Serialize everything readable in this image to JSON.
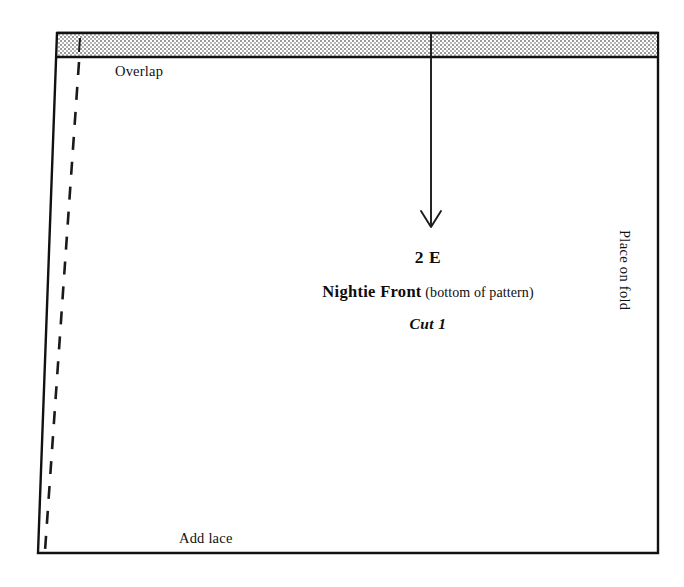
{
  "document": {
    "type": "sewing-pattern-piece",
    "background_color": "#ffffff",
    "ink_color": "#111111"
  },
  "piece": {
    "number": "2 E",
    "title": "Nightie Front",
    "title_note": "(bottom of pattern)",
    "cut_count": "Cut 1"
  },
  "labels": {
    "overlap": "Overlap",
    "add_lace": "Add lace",
    "place_on_fold": "Place on fold"
  },
  "markings": {
    "overlap_band": {
      "name": "overlap-allowance-band",
      "fill": "#c9c9c9",
      "pattern": "stipple-dither"
    },
    "grainline_arrow": {
      "name": "grainline-arrow",
      "direction": "down",
      "x": 431,
      "y_start": 33,
      "y_end": 227
    },
    "seam_allowance_dashed_line": {
      "name": "cutting-line-dashed",
      "style": "dashed",
      "dash_length": 13,
      "gap_length": 12
    },
    "fold_edge": {
      "name": "fold-edge-right",
      "side": "right"
    }
  },
  "geometry": {
    "outline_points": "57,33 658,33 658,553 38,553",
    "band_top": 33,
    "band_bottom": 57,
    "band_divider_x": 431
  }
}
